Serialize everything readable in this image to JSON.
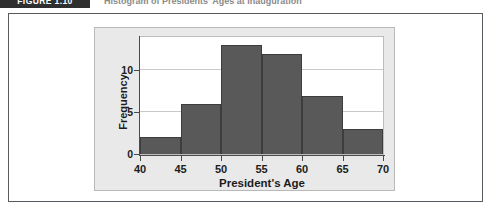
{
  "header": {
    "figure_tag": "FIGURE 1.10",
    "caption": "Histogram of Presidents' Ages at Inauguration"
  },
  "chart_data": {
    "type": "bar",
    "title": "",
    "xlabel": "President's Age",
    "ylabel": "Frequency",
    "bin_edges": [
      40,
      45,
      50,
      55,
      60,
      65,
      70
    ],
    "categories": [
      "40-45",
      "45-50",
      "50-55",
      "55-60",
      "60-65",
      "65-70"
    ],
    "values": [
      2,
      6,
      13,
      12,
      7,
      3
    ],
    "xticks": [
      "40",
      "45",
      "50",
      "55",
      "60",
      "65",
      "70"
    ],
    "yticks": [
      "0",
      "5",
      "10"
    ],
    "xlim": [
      40,
      70
    ],
    "ylim": [
      0,
      14
    ],
    "grid": "horizontal",
    "legend": "none",
    "bar_color": "#595959",
    "panel_color": "#e9e9e9",
    "plot_background": "#ffffff"
  }
}
